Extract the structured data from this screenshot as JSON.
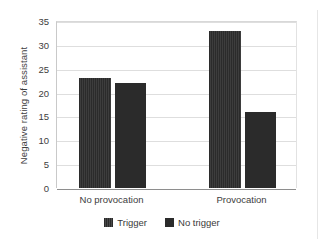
{
  "page": {
    "top_sliver_fragments": [
      "·",
      "·",
      "·"
    ]
  },
  "chart_data": {
    "type": "bar",
    "title": "",
    "subtitle": "",
    "xlabel": "",
    "ylabel": "Negative rating of assistant",
    "categories": [
      "No provocation",
      "Provocation"
    ],
    "series": [
      {
        "name": "Trigger",
        "values": [
          23,
          22
        ],
        "color": "#2b2b2b",
        "pattern": "striped"
      },
      {
        "name": "No trigger",
        "values": [
          33,
          16
        ],
        "color": "#2b2b2b",
        "pattern": "solid"
      }
    ],
    "note_on_grouping": "Bars are drawn in plot order: No provocation Trigger=23, No provocation No trigger=22, Provocation Trigger=33, Provocation No trigger=16",
    "bars": [
      {
        "group": "No provocation",
        "series": "Trigger",
        "value": 23,
        "pattern": "striped"
      },
      {
        "group": "No provocation",
        "series": "No trigger",
        "value": 22,
        "pattern": "solid"
      },
      {
        "group": "Provocation",
        "series": "Trigger",
        "value": 33,
        "pattern": "striped"
      },
      {
        "group": "Provocation",
        "series": "No trigger",
        "value": 16,
        "pattern": "solid"
      }
    ],
    "ylim": [
      0,
      35
    ],
    "yticks": [
      0,
      5,
      10,
      15,
      20,
      25,
      30,
      35
    ],
    "ytick_labels": [
      "0",
      "5",
      "10",
      "15",
      "20",
      "25",
      "30",
      "35"
    ],
    "grid": true,
    "grid_axis": "y",
    "legend": {
      "position": "bottom-center",
      "entries": [
        {
          "label": "Trigger",
          "color": "#2b2b2b",
          "pattern": "striped"
        },
        {
          "label": "No trigger",
          "color": "#2b2b2b",
          "pattern": "solid"
        }
      ]
    },
    "colors": {
      "bar": "#2b2b2b",
      "gridline": "#dedede",
      "axis": "#8e8e8e",
      "text": "#3a3a3a",
      "background": "#ffffff"
    }
  }
}
